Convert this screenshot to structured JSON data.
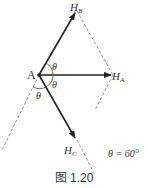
{
  "diagram": {
    "point_label": "A",
    "vectors": [
      {
        "label": "H",
        "sub": "B"
      },
      {
        "label": "H",
        "sub": "A"
      },
      {
        "label": "H",
        "sub": "C"
      }
    ],
    "angle_label": "θ",
    "condition": "θ = 60°",
    "caption": "图 1.20"
  }
}
